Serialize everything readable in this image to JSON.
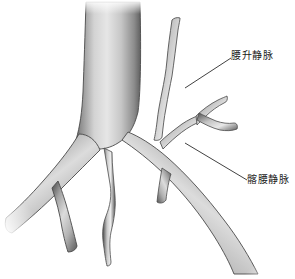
{
  "figure": {
    "kind": "anatomical-illustration",
    "background_color": "#ffffff",
    "vessel_outline_color": "#3a3a3a",
    "vessel_shade_dark": "#6b6b6b",
    "vessel_shade_mid": "#9a9a9a",
    "vessel_shade_light": "#e2e2e2",
    "leader_line_color": "#2b2b2b",
    "text_color": "#1a1a1a"
  },
  "annotations": [
    {
      "id": "ascending-lumbar-vein",
      "label": "腰升静脉",
      "leader_from_x": 185,
      "leader_from_y": 88,
      "leader_to_x": 231,
      "leader_to_y": 58
    },
    {
      "id": "iliolumbar-vein",
      "label": "髂腰静脉",
      "leader_from_x": 185,
      "leader_from_y": 143,
      "leader_to_x": 247,
      "leader_to_y": 180
    }
  ],
  "vessels": [
    {
      "id": "inferior-vena-cava",
      "name": "下腔静脉主干"
    },
    {
      "id": "left-common-iliac-vein",
      "name": "左髂总静脉"
    },
    {
      "id": "right-common-iliac-vein",
      "name": "右髂总静脉"
    },
    {
      "id": "ascending-lumbar-vein",
      "name": "腰升静脉"
    },
    {
      "id": "iliolumbar-vein",
      "name": "髂腰静脉"
    },
    {
      "id": "median-sacral-vein",
      "name": "骶正中静脉"
    },
    {
      "id": "left-iliac-branch",
      "name": "左侧分支"
    }
  ]
}
